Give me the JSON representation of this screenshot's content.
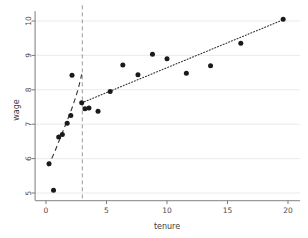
{
  "chart_data": {
    "type": "scatter",
    "title": "",
    "xlabel": "tenure",
    "ylabel": "wage",
    "xlim": [
      -0.9,
      21.0
    ],
    "ylim": [
      4.78,
      10.28
    ],
    "xticks": [
      0,
      5,
      10,
      15,
      20
    ],
    "yticks": [
      5,
      6,
      7,
      8,
      9,
      10
    ],
    "xtick_labels": [
      "0",
      "5",
      "10",
      "15",
      "20"
    ],
    "ytick_labels": [
      "5",
      "6",
      "7",
      "8",
      "9",
      "10"
    ],
    "grid": "horizontal",
    "legend": "none",
    "points": [
      {
        "x": 0.25,
        "y": 5.85
      },
      {
        "x": 0.62,
        "y": 5.08
      },
      {
        "x": 1.05,
        "y": 6.63
      },
      {
        "x": 1.35,
        "y": 6.7
      },
      {
        "x": 1.75,
        "y": 7.03
      },
      {
        "x": 2.05,
        "y": 7.25
      },
      {
        "x": 2.15,
        "y": 8.42
      },
      {
        "x": 2.95,
        "y": 7.62
      },
      {
        "x": 3.22,
        "y": 7.45
      },
      {
        "x": 3.55,
        "y": 7.47
      },
      {
        "x": 4.3,
        "y": 7.38
      },
      {
        "x": 5.3,
        "y": 7.95
      },
      {
        "x": 6.35,
        "y": 8.72
      },
      {
        "x": 7.6,
        "y": 8.44
      },
      {
        "x": 8.8,
        "y": 9.03
      },
      {
        "x": 10.0,
        "y": 8.9
      },
      {
        "x": 11.6,
        "y": 8.48
      },
      {
        "x": 13.6,
        "y": 8.7
      },
      {
        "x": 16.1,
        "y": 9.35
      },
      {
        "x": 19.6,
        "y": 10.05
      }
    ],
    "breakpoint": {
      "x": 3.0,
      "style": "dashed",
      "color": "#999999"
    },
    "fits": [
      {
        "name": "left-segment-fit",
        "style": "dashed",
        "color": "#333333",
        "x": [
          0.18,
          0.7,
          1.2,
          1.7,
          2.1,
          2.45,
          2.7,
          2.85,
          2.95
        ],
        "y": [
          5.78,
          6.18,
          6.62,
          7.06,
          7.42,
          7.78,
          8.08,
          8.3,
          8.45
        ]
      },
      {
        "name": "right-segment-fit",
        "style": "dotted",
        "color": "#333333",
        "x": [
          2.95,
          19.7
        ],
        "y": [
          7.62,
          10.05
        ]
      }
    ]
  },
  "axes": {
    "x_axis_name": "tenure-axis",
    "y_axis_name": "wage-axis"
  }
}
